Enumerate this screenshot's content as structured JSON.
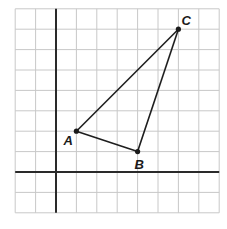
{
  "diagram": {
    "type": "coordinate-grid-triangle",
    "grid": {
      "x_min": -2,
      "x_max": 8,
      "y_min": -2,
      "y_max": 8,
      "unit_px": 20.4,
      "origin_px": [
        56,
        172
      ]
    },
    "points": [
      {
        "label": "A",
        "x": 1,
        "y": 2,
        "label_dx": -13,
        "label_dy": 14
      },
      {
        "label": "B",
        "x": 4,
        "y": 1,
        "label_dx": -3,
        "label_dy": 17
      },
      {
        "label": "C",
        "x": 6,
        "y": 7,
        "label_dx": 3,
        "label_dy": -4
      }
    ],
    "edges": [
      [
        "A",
        "B"
      ],
      [
        "B",
        "C"
      ],
      [
        "C",
        "A"
      ]
    ],
    "colors": {
      "grid": "#c8c8c8",
      "axis": "#2a2a2a",
      "edge": "#1e1e1e",
      "background": "#ffffff"
    }
  },
  "labels": {
    "A": "A",
    "B": "B",
    "C": "C"
  }
}
